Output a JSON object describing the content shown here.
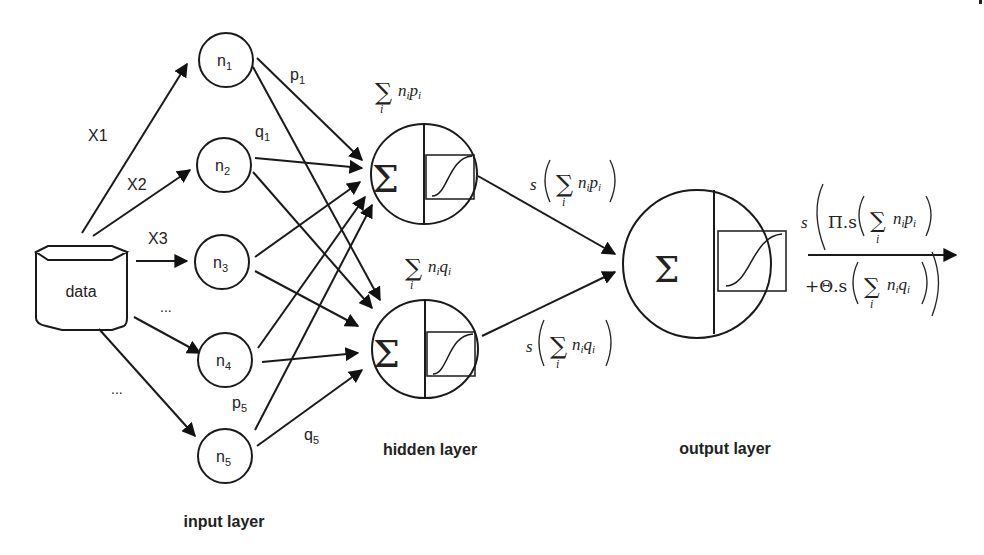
{
  "diagram": {
    "data_source": {
      "label": "data"
    },
    "input_arrows": [
      {
        "label": "X1",
        "to": "n1"
      },
      {
        "label": "X2",
        "to": "n2"
      },
      {
        "label": "X3",
        "to": "n3"
      },
      {
        "label": "...",
        "to": "n4"
      },
      {
        "label": "...",
        "to": "n5"
      }
    ],
    "input_nodes": [
      {
        "id": "n1",
        "base": "n",
        "sub": "1"
      },
      {
        "id": "n2",
        "base": "n",
        "sub": "2"
      },
      {
        "id": "n3",
        "base": "n",
        "sub": "3"
      },
      {
        "id": "n4",
        "base": "n",
        "sub": "4"
      },
      {
        "id": "n5",
        "base": "n",
        "sub": "5"
      }
    ],
    "weight_labels": [
      {
        "base": "p",
        "sub": "1"
      },
      {
        "base": "q",
        "sub": "1"
      },
      {
        "base": "p",
        "sub": "5"
      },
      {
        "base": "q",
        "sub": "5"
      }
    ],
    "hidden_nodes": [
      {
        "id": "h1",
        "sum_symbol": "Σ",
        "input_formula": {
          "sum": "∑",
          "index": "i",
          "term": "n",
          "term_sub": "i",
          "weight": "p",
          "weight_sub": "i"
        }
      },
      {
        "id": "h2",
        "sum_symbol": "Σ",
        "input_formula": {
          "sum": "∑",
          "index": "i",
          "term": "n",
          "term_sub": "i",
          "weight": "q",
          "weight_sub": "i"
        }
      }
    ],
    "hidden_outputs": [
      {
        "func": "s",
        "sum": "∑",
        "index": "i",
        "term": "n",
        "term_sub": "i",
        "weight": "p",
        "weight_sub": "i"
      },
      {
        "func": "s",
        "sum": "∑",
        "index": "i",
        "term": "n",
        "term_sub": "i",
        "weight": "q",
        "weight_sub": "i"
      }
    ],
    "output_node": {
      "sum_symbol": "Σ"
    },
    "final_output": {
      "func": "s",
      "line1_coef": "Π.s",
      "line2_coef": "+Θ.s",
      "sum": "∑",
      "index": "i",
      "term": "n",
      "term_sub": "i",
      "weight1": "p",
      "weight2": "q",
      "weight_sub": "i"
    },
    "layer_labels": {
      "input": "input layer",
      "hidden": "hidden layer",
      "output": "output layer"
    }
  }
}
